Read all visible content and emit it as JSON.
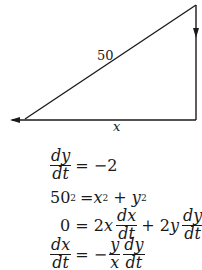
{
  "diagram": {
    "hypotenuse_label": "50",
    "base_label": "x",
    "stroke_color": "#1a1a1a"
  },
  "equations": {
    "eq1": {
      "num": "dy",
      "den": "dt",
      "rhs": "= −2"
    },
    "eq2": {
      "lhs": "50",
      "lhs_exp": "2",
      "mid": "= ",
      "x": "x",
      "x_exp": "2",
      "plus": " + ",
      "y": "y",
      "y_exp": "2"
    },
    "eq3": {
      "lhs": "0 = 2",
      "x": "x",
      "f1_num": "dx",
      "f1_den": "dt",
      "plus": "+ 2",
      "y": "y",
      "f2_num": "dy",
      "f2_den": "dt"
    },
    "eq4": {
      "num": "dx",
      "den": "dt",
      "mid": "= −",
      "f1_num": "y",
      "f1_den": "x",
      "f2_num": "dy",
      "f2_den": "dt"
    }
  }
}
